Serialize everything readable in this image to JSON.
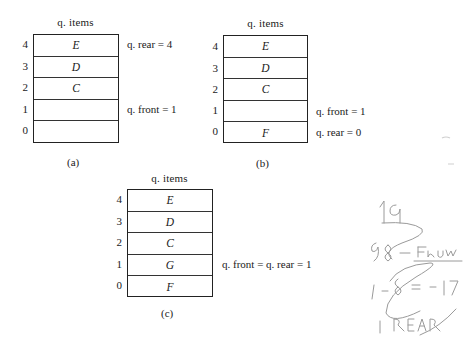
{
  "diagrams": [
    {
      "id": "a",
      "title": "q. items",
      "cells": [
        {
          "index": "4",
          "value": "E"
        },
        {
          "index": "3",
          "value": "D"
        },
        {
          "index": "2",
          "value": "C"
        },
        {
          "index": "1",
          "value": ""
        },
        {
          "index": "0",
          "value": ""
        }
      ],
      "annotations": {
        "rear": "q. rear = 4",
        "front": "q. front = 1"
      },
      "caption": "(a)"
    },
    {
      "id": "b",
      "title": "q. items",
      "cells": [
        {
          "index": "4",
          "value": "E"
        },
        {
          "index": "3",
          "value": "D"
        },
        {
          "index": "2",
          "value": "C"
        },
        {
          "index": "1",
          "value": ""
        },
        {
          "index": "0",
          "value": "F"
        }
      ],
      "annotations": {
        "front": "q. front = 1",
        "rear": "q. rear = 0"
      },
      "caption": "(b)"
    },
    {
      "id": "c",
      "title": "q. items",
      "cells": [
        {
          "index": "4",
          "value": "E"
        },
        {
          "index": "3",
          "value": "D"
        },
        {
          "index": "2",
          "value": "C"
        },
        {
          "index": "1",
          "value": "G"
        },
        {
          "index": "0",
          "value": "F"
        }
      ],
      "annotations": {
        "front_rear": "q. front = q. rear = 1"
      },
      "caption": "(c)"
    }
  ],
  "handwriting": {
    "lines": [
      "19",
      "q8 - Fnuw",
      "1 - q8 = -17",
      "1 REAR"
    ],
    "ink_color": "#9a9a9a"
  }
}
